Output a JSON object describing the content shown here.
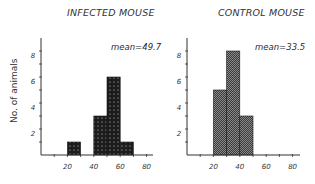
{
  "y_axis_label": "No. of animals",
  "panels": [
    {
      "title": "INFECTED MOUSE",
      "mean_label": "mean=49.7"
    },
    {
      "title": "CONTROL MOUSE",
      "mean_label": "mean=33.5"
    }
  ],
  "colors": {
    "infected_fill": "#1c1c1c",
    "infected_dots": "#d8d8d8",
    "control_fill": "#3a3a3a",
    "control_check": "#8a8a8a",
    "axis": "#333333"
  },
  "chart_data": [
    {
      "type": "bar",
      "title": "INFECTED MOUSE",
      "xlabel": "",
      "ylabel": "No. of animals",
      "bins": [
        [
          20,
          30
        ],
        [
          40,
          50
        ],
        [
          50,
          60
        ],
        [
          60,
          70
        ]
      ],
      "categories": [
        "20-30",
        "40-50",
        "50-60",
        "60-70"
      ],
      "values": [
        1,
        3,
        6,
        1
      ],
      "annotation": "mean=49.7",
      "xlim": [
        0,
        85
      ],
      "ylim": [
        0,
        8.5
      ],
      "xticks": [
        10,
        20,
        30,
        40,
        50,
        60,
        70,
        80
      ],
      "xtick_labels": [
        "20",
        "40",
        "60",
        "80"
      ],
      "yticks": [
        1,
        2,
        3,
        4,
        5,
        6,
        7,
        8
      ],
      "ytick_labels": [
        "2",
        "4",
        "6",
        "8"
      ],
      "grid": false,
      "legend": null
    },
    {
      "type": "bar",
      "title": "CONTROL MOUSE",
      "xlabel": "",
      "ylabel": "No. of animals",
      "bins": [
        [
          20,
          30
        ],
        [
          30,
          40
        ],
        [
          40,
          50
        ]
      ],
      "categories": [
        "20-30",
        "30-40",
        "40-50"
      ],
      "values": [
        5,
        8,
        3
      ],
      "annotation": "mean=33.5",
      "xlim": [
        0,
        85
      ],
      "ylim": [
        0,
        8.5
      ],
      "xticks": [
        10,
        20,
        30,
        40,
        50,
        60,
        70,
        80
      ],
      "xtick_labels": [
        "20",
        "40",
        "60",
        "80"
      ],
      "yticks": [
        1,
        2,
        3,
        4,
        5,
        6,
        7,
        8
      ],
      "ytick_labels": [
        "2",
        "4",
        "6",
        "8"
      ],
      "grid": false,
      "legend": null
    }
  ]
}
